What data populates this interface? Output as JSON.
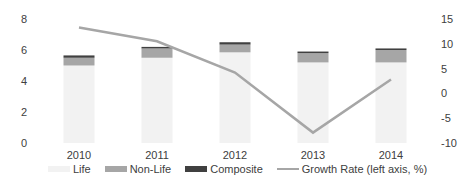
{
  "chart_data": {
    "type": "bar",
    "subtype": "stacked bar with line on secondary axis",
    "title": "",
    "categories": [
      "2010",
      "2011",
      "2012",
      "2013",
      "2014"
    ],
    "series": [
      {
        "name": "Life",
        "type": "bar",
        "axis": "primary",
        "color": "#f2f2f2",
        "values": [
          5.0,
          5.5,
          5.85,
          5.2,
          5.2
        ]
      },
      {
        "name": "Non-Life",
        "type": "bar",
        "axis": "primary",
        "color": "#a6a6a6",
        "values": [
          0.5,
          0.6,
          0.5,
          0.6,
          0.8
        ]
      },
      {
        "name": "Composite",
        "type": "bar",
        "axis": "primary",
        "color": "#404040",
        "values": [
          0.15,
          0.1,
          0.15,
          0.1,
          0.1
        ]
      },
      {
        "name": "Growth Rate (left axis, %)",
        "type": "line",
        "axis": "secondary",
        "color": "#a6a6a6",
        "values": [
          13.3,
          10.5,
          4.2,
          -7.9,
          2.8
        ]
      }
    ],
    "primary_axis": {
      "ylim": [
        0,
        8
      ],
      "ticks": [
        "0",
        "2",
        "4",
        "6",
        "8"
      ],
      "position": "left"
    },
    "secondary_axis": {
      "ylim": [
        -10,
        15
      ],
      "ticks": [
        "-10",
        "-5",
        "0",
        "5",
        "10",
        "15"
      ],
      "position": "right"
    },
    "xlabel": "",
    "ylabel": "",
    "grid": false,
    "legend_position": "bottom"
  },
  "legend": {
    "items": [
      {
        "label": "Life",
        "color": "#f2f2f2",
        "kind": "box"
      },
      {
        "label": "Non-Life",
        "color": "#a6a6a6",
        "kind": "box"
      },
      {
        "label": "Composite",
        "color": "#404040",
        "kind": "box"
      },
      {
        "label": "Growth Rate (left axis, %)",
        "color": "#a6a6a6",
        "kind": "line"
      }
    ]
  }
}
